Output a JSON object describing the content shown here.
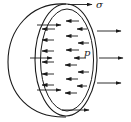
{
  "diagram": {
    "labels": {
      "stress": "σ",
      "pressure": "p"
    },
    "colors": {
      "stroke": "#1a1a1a",
      "background": "#ffffff"
    },
    "arrows": {
      "stress_arrows": [
        {
          "x1": 68,
          "y1": 4.5,
          "x2": 92,
          "y2": 4.5
        },
        {
          "x1": 62,
          "y1": 110,
          "x2": 89,
          "y2": 110
        }
      ],
      "outward_arrows": [
        {
          "x1": 97,
          "y1": 31,
          "x2": 121,
          "y2": 31
        },
        {
          "x1": 99,
          "y1": 58,
          "x2": 123,
          "y2": 58
        },
        {
          "x1": 97,
          "y1": 83,
          "x2": 121,
          "y2": 83
        }
      ],
      "long_pressure_arrows": [
        {
          "x1": 37,
          "y1": 25,
          "x2": 61,
          "y2": 25
        },
        {
          "x1": 30,
          "y1": 58,
          "x2": 52,
          "y2": 58
        },
        {
          "x1": 37,
          "y1": 90,
          "x2": 61,
          "y2": 90
        }
      ],
      "short_pressure_arrows": [
        {
          "x1": 55,
          "y1": 29,
          "x2": 42,
          "y2": 29
        },
        {
          "x1": 79,
          "y1": 21,
          "x2": 66,
          "y2": 21
        },
        {
          "x1": 87,
          "y1": 29,
          "x2": 77,
          "y2": 29
        },
        {
          "x1": 54,
          "y1": 40,
          "x2": 42,
          "y2": 40
        },
        {
          "x1": 78,
          "y1": 36,
          "x2": 66,
          "y2": 36
        },
        {
          "x1": 89,
          "y1": 43,
          "x2": 78,
          "y2": 43
        },
        {
          "x1": 54,
          "y1": 51,
          "x2": 42,
          "y2": 51
        },
        {
          "x1": 79,
          "y1": 50,
          "x2": 66,
          "y2": 50
        },
        {
          "x1": 54,
          "y1": 62,
          "x2": 42,
          "y2": 62
        },
        {
          "x1": 86,
          "y1": 58,
          "x2": 74,
          "y2": 58
        },
        {
          "x1": 77,
          "y1": 65,
          "x2": 65,
          "y2": 65
        },
        {
          "x1": 54,
          "y1": 74,
          "x2": 42,
          "y2": 74
        },
        {
          "x1": 89,
          "y1": 72,
          "x2": 78,
          "y2": 72
        },
        {
          "x1": 78,
          "y1": 79,
          "x2": 66,
          "y2": 79
        },
        {
          "x1": 54,
          "y1": 85,
          "x2": 42,
          "y2": 85
        },
        {
          "x1": 87,
          "y1": 86,
          "x2": 77,
          "y2": 86
        },
        {
          "x1": 77,
          "y1": 93,
          "x2": 65,
          "y2": 93
        }
      ]
    }
  }
}
